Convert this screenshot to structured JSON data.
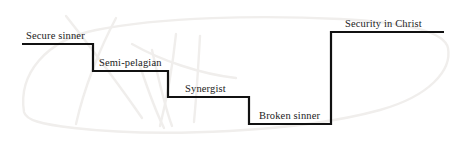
{
  "diagram": {
    "type": "step-chart",
    "background_color": "#ffffff",
    "line_color": "#111111",
    "line_width": 2.2,
    "text_color": "#1b1b1b",
    "watermark_color": "#f0eeec",
    "canvas": {
      "width": 456,
      "height": 150
    }
  },
  "steps": [
    {
      "label": "Secure sinner",
      "level": 1,
      "y": 44,
      "x_start": 22,
      "x_end": 93,
      "label_x": 26,
      "label_y": 31
    },
    {
      "label": "Semi-pelagian",
      "level": 2,
      "y": 71,
      "x_start": 93,
      "x_end": 168,
      "label_x": 99,
      "label_y": 58
    },
    {
      "label": "Synergist",
      "level": 3,
      "y": 97,
      "x_start": 168,
      "x_end": 249,
      "label_x": 185,
      "label_y": 84
    },
    {
      "label": "Broken sinner",
      "level": 4,
      "y": 124,
      "x_start": 249,
      "x_end": 331,
      "label_x": 259,
      "label_y": 111
    },
    {
      "label": "Security in Christ",
      "level": 5,
      "y": 32,
      "x_start": 331,
      "x_end": 444,
      "label_x": 345,
      "label_y": 19
    }
  ],
  "path": {
    "points": "22,44 93,44 93,71 168,71 168,97 249,97 249,124 331,124 331,32 444,32"
  },
  "watermark": {
    "strokes": [
      "M 24,112 C 18,74 46,40 96,30 C 160,17 260,15 340,19 C 400,22 444,30 448,48 C 452,70 430,96 380,110 C 300,132 160,138 74,128 C 40,124 26,120 24,112 Z",
      "M 66,16 C 88,44 120,86 142,118",
      "M 116,18 C 100,48 84,88 76,124",
      "M 132,44 C 160,60 200,74 236,78",
      "M 140,66 C 150,96 158,116 164,128",
      "M 152,50 C 160,86 166,110 172,126",
      "M 176,34 C 172,72 166,102 160,126",
      "M 200,36 C 198,72 196,100 194,122"
    ]
  }
}
